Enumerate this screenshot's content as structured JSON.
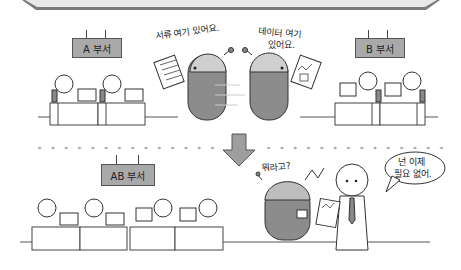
{
  "scene": {
    "top_section": {
      "department_a": {
        "label": "A 부서"
      },
      "department_b": {
        "label": "B 부서"
      },
      "robot_a_speech": "서류 여기 있어요.",
      "robot_b_speech_line1": "데이터 여기",
      "robot_b_speech_line2": "있어요."
    },
    "bottom_section": {
      "department_ab": {
        "label": "AB 부서"
      },
      "robot_speech": "뭐라고?",
      "person_speech_line1": "넌 이제",
      "person_speech_line2": "필요 없어."
    },
    "colors": {
      "banner_fill": "#e8e8e8",
      "banner_edge": "#777777",
      "label_fill": "#a9a9a9",
      "robot_fill": "#8c8c8c",
      "arrow_fill": "#9e9e9e",
      "dot_color": "#aaaaaa"
    }
  }
}
